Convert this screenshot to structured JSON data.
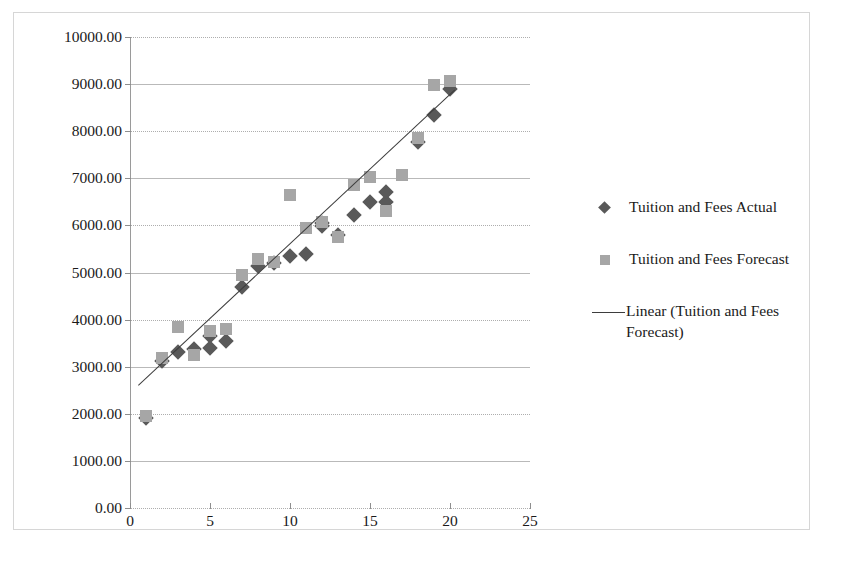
{
  "chart_data": {
    "type": "scatter",
    "title": "",
    "subtitle": "",
    "xlabel": "",
    "ylabel": "",
    "xlim": [
      0,
      25
    ],
    "ylim": [
      0,
      10000
    ],
    "xticks": [
      0,
      5,
      10,
      15,
      20,
      25
    ],
    "yticks": [
      0,
      1000,
      2000,
      3000,
      4000,
      5000,
      6000,
      7000,
      8000,
      9000,
      10000
    ],
    "xtick_labels": [
      "0",
      "5",
      "10",
      "15",
      "20",
      "25"
    ],
    "ytick_labels": [
      "0.00",
      "1000.00",
      "2000.00",
      "3000.00",
      "4000.00",
      "5000.00",
      "6000.00",
      "7000.00",
      "8000.00",
      "9000.00",
      "10000.00"
    ],
    "grid": true,
    "legend_position": "right",
    "series": [
      {
        "name": "Tuition and Fees Actual",
        "marker": "diamond",
        "color": "#595959",
        "points": [
          {
            "x": 1,
            "y": 1910
          },
          {
            "x": 2,
            "y": 3130
          },
          {
            "x": 3,
            "y": 3320
          },
          {
            "x": 4,
            "y": 3370
          },
          {
            "x": 5,
            "y": 3650
          },
          {
            "x": 5,
            "y": 3400
          },
          {
            "x": 6,
            "y": 3540
          },
          {
            "x": 7,
            "y": 4700
          },
          {
            "x": 8,
            "y": 5140
          },
          {
            "x": 9,
            "y": 5210
          },
          {
            "x": 10,
            "y": 5350
          },
          {
            "x": 11,
            "y": 5400
          },
          {
            "x": 12,
            "y": 5980
          },
          {
            "x": 12,
            "y": 6060
          },
          {
            "x": 13,
            "y": 5800
          },
          {
            "x": 14,
            "y": 6220
          },
          {
            "x": 15,
            "y": 6500
          },
          {
            "x": 16,
            "y": 6500
          },
          {
            "x": 16,
            "y": 6700
          },
          {
            "x": 18,
            "y": 7780
          },
          {
            "x": 19,
            "y": 8350
          },
          {
            "x": 20,
            "y": 8900
          }
        ]
      },
      {
        "name": "Tuition and Fees Forecast",
        "marker": "square",
        "color": "#a6a6a6",
        "points": [
          {
            "x": 1,
            "y": 1960
          },
          {
            "x": 2,
            "y": 3180
          },
          {
            "x": 3,
            "y": 3840
          },
          {
            "x": 4,
            "y": 3240
          },
          {
            "x": 5,
            "y": 3760
          },
          {
            "x": 6,
            "y": 3790
          },
          {
            "x": 7,
            "y": 4940
          },
          {
            "x": 8,
            "y": 5280
          },
          {
            "x": 9,
            "y": 5230
          },
          {
            "x": 10,
            "y": 6650
          },
          {
            "x": 11,
            "y": 5950
          },
          {
            "x": 12,
            "y": 6080
          },
          {
            "x": 13,
            "y": 5760
          },
          {
            "x": 14,
            "y": 6860
          },
          {
            "x": 15,
            "y": 7020
          },
          {
            "x": 16,
            "y": 6300
          },
          {
            "x": 17,
            "y": 7060
          },
          {
            "x": 18,
            "y": 7850
          },
          {
            "x": 19,
            "y": 8980
          },
          {
            "x": 20,
            "y": 9060
          }
        ]
      }
    ],
    "trendline": {
      "name": "Linear (Tuition and Fees Forecast)",
      "color": "#3d3d3d",
      "x_start": 0.5,
      "y_start": 2620,
      "x_end": 20.3,
      "y_end": 8900
    }
  },
  "legend": {
    "entries": [
      {
        "label": "Tuition and Fees Actual",
        "marker": "diamond"
      },
      {
        "label": "Tuition and Fees Forecast",
        "marker": "square"
      },
      {
        "label": "Linear (Tuition and Fees\nForecast)",
        "marker": "line"
      }
    ]
  }
}
